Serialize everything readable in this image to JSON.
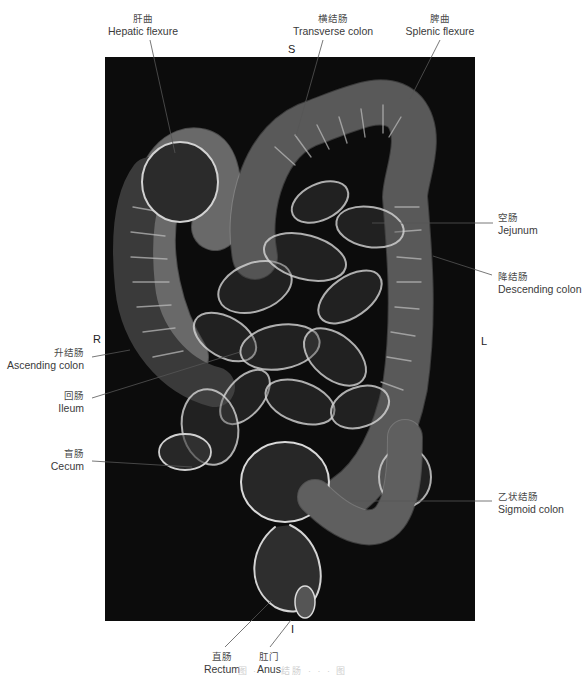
{
  "figure": {
    "background_color": "#0c0c0c",
    "structure_color": "#d8d8d8",
    "orientation": {
      "superior": "S",
      "inferior": "I",
      "right": "R",
      "left": "L"
    },
    "labels": {
      "hepatic_flexure": {
        "zh": "肝曲",
        "en": "Hepatic flexure"
      },
      "transverse_colon": {
        "zh": "横结肠",
        "en": "Transverse colon"
      },
      "splenic_flexure": {
        "zh": "脾曲",
        "en": "Splenic flexure"
      },
      "jejunum": {
        "zh": "空肠",
        "en": "Jejunum"
      },
      "descending_colon": {
        "zh": "降结肠",
        "en": "Descending colon"
      },
      "ascending_colon": {
        "zh": "升结肠",
        "en": "Ascending colon"
      },
      "ileum": {
        "zh": "回肠",
        "en": "Ileum"
      },
      "cecum": {
        "zh": "盲肠",
        "en": "Cecum"
      },
      "sigmoid_colon": {
        "zh": "乙状结肠",
        "en": "Sigmoid colon"
      },
      "rectum": {
        "zh": "直肠",
        "en": "Rectum"
      },
      "anus": {
        "zh": "肛门",
        "en": "Anus"
      }
    },
    "caption": "图 · · ·  结肠 · · ·  图"
  }
}
